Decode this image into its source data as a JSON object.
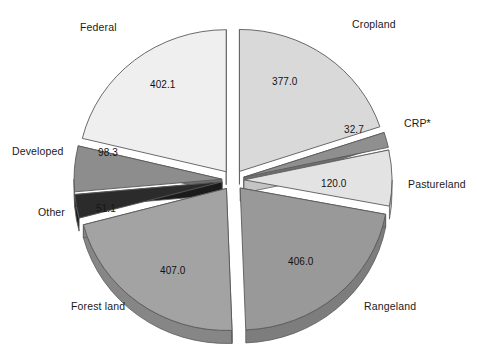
{
  "chart_data": {
    "type": "pie",
    "title": "",
    "subtitle": "",
    "xlabel": "",
    "ylabel": "",
    "legend_position": "none",
    "grid": false,
    "units": "million acres",
    "total": 1894.2,
    "slices": [
      {
        "label": "Cropland",
        "value": 377.0,
        "value_text": "377.0",
        "color": "#d9d9d9",
        "side_color": "#bdbdbd",
        "top_color": "#e8e8e8"
      },
      {
        "label": "CRP*",
        "value": 32.7,
        "value_text": "32.7",
        "color": "#8f8f8f",
        "side_color": "#6f6f6f",
        "top_color": "#a8a8a8"
      },
      {
        "label": "Pastureland",
        "value": 120.0,
        "value_text": "120.0",
        "color": "#e3e3e3",
        "side_color": "#c4c4c4",
        "top_color": "#efefef"
      },
      {
        "label": "Rangeland",
        "value": 406.0,
        "value_text": "406.0",
        "color": "#999999",
        "side_color": "#7d7d7d",
        "top_color": "#b0b0b0"
      },
      {
        "label": "Forest land",
        "value": 407.0,
        "value_text": "407.0",
        "color": "#a3a3a3",
        "side_color": "#868686",
        "top_color": "#bababa"
      },
      {
        "label": "Other",
        "value": 51.1,
        "value_text": "51.1",
        "color": "#2b2b2b",
        "side_color": "#1b1b1b",
        "top_color": "#4a4a4a"
      },
      {
        "label": "Developed",
        "value": 98.3,
        "value_text": "98.3",
        "color": "#8d8d8d",
        "side_color": "#707070",
        "top_color": "#a5a5a5"
      },
      {
        "label": "Federal",
        "value": 402.1,
        "value_text": "402.1",
        "color": "#efefef",
        "side_color": "#cfcfcf",
        "top_color": "#f7f7f7"
      }
    ],
    "category_labels": {
      "cropland": "Cropland",
      "crp": "CRP*",
      "pastureland": "Pastureland",
      "rangeland": "Rangeland",
      "forest_land": "Forest land",
      "other": "Other",
      "developed": "Developed",
      "federal": "Federal"
    },
    "value_labels": {
      "cropland": "377.0",
      "crp": "32.7",
      "pastureland": "120.0",
      "rangeland": "406.0",
      "forest_land": "407.0",
      "other": "51.1",
      "developed": "98.3",
      "federal": "402.1"
    }
  },
  "colors": {
    "outline": "#5a5a5a",
    "background": "#ffffff",
    "text": "#1a1a1a"
  }
}
